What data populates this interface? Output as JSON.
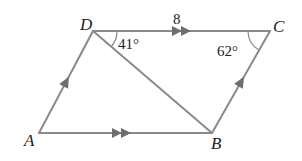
{
  "figure": {
    "type": "parallelogram",
    "vertices": {
      "A": {
        "label": "A",
        "x": 39,
        "y": 133
      },
      "B": {
        "label": "B",
        "x": 212,
        "y": 133
      },
      "C": {
        "label": "C",
        "x": 270,
        "y": 31
      },
      "D": {
        "label": "D",
        "x": 93,
        "y": 31
      }
    },
    "edges": [
      {
        "from": "A",
        "to": "B",
        "marker": "double-arrow"
      },
      {
        "from": "D",
        "to": "C",
        "marker": "double-arrow",
        "length_label": "8"
      },
      {
        "from": "A",
        "to": "D",
        "marker": "single-arrow"
      },
      {
        "from": "B",
        "to": "C",
        "marker": "single-arrow"
      },
      {
        "from": "D",
        "to": "B",
        "marker": "none",
        "role": "diagonal"
      }
    ],
    "angles": {
      "angle_D": {
        "label": "41°",
        "vertex": "D",
        "between": [
          "DC",
          "DB"
        ]
      },
      "angle_C": {
        "label": "62°",
        "vertex": "C",
        "between": [
          "CD",
          "CB"
        ]
      }
    },
    "side_label_DC": "8",
    "colors": {
      "line": "#8a8a8a",
      "arrow": "#6e6e6e",
      "text": "#222222",
      "background": "#ffffff"
    }
  }
}
